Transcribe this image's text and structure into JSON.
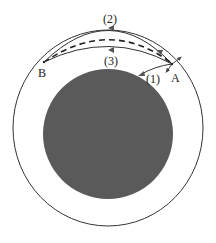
{
  "diagram": {
    "labels": {
      "path1": "(1)",
      "path2": "(2)",
      "path3": "(3)",
      "pointA": "A",
      "pointB": "B"
    },
    "colors": {
      "planet": "#5a5a5a",
      "line": "#333333",
      "background": "#ffffff"
    }
  }
}
